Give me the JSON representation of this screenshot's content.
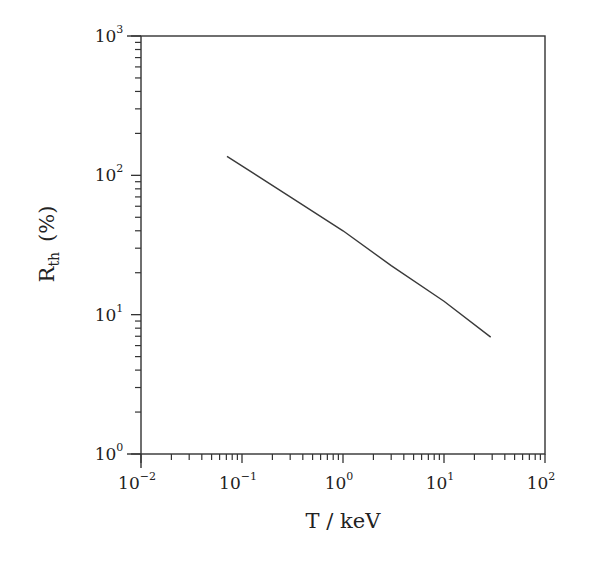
{
  "chart_data": {
    "type": "line",
    "title": "",
    "xlabel": "T / keV",
    "ylabel": "R_th (%)",
    "ylabel_main": "R",
    "ylabel_sub": "th",
    "ylabel_unit": "(%)",
    "xscale": "log",
    "yscale": "log",
    "xlim": [
      0.01,
      100
    ],
    "ylim": [
      1,
      1000
    ],
    "grid": false,
    "legend": null,
    "x_ticks": [
      "10^-2",
      "10^-1",
      "10^0",
      "10^1",
      "10^2"
    ],
    "y_ticks": [
      "10^0",
      "10^1",
      "10^2",
      "10^3"
    ],
    "x_tick_labels": [
      {
        "base": "10",
        "exp": "-2",
        "value": 0.01
      },
      {
        "base": "10",
        "exp": "-1",
        "value": 0.1
      },
      {
        "base": "10",
        "exp": "0",
        "value": 1
      },
      {
        "base": "10",
        "exp": "1",
        "value": 10
      },
      {
        "base": "10",
        "exp": "2",
        "value": 100
      }
    ],
    "y_tick_labels": [
      {
        "base": "10",
        "exp": "0",
        "value": 1
      },
      {
        "base": "10",
        "exp": "1",
        "value": 10
      },
      {
        "base": "10",
        "exp": "2",
        "value": 100
      },
      {
        "base": "10",
        "exp": "3",
        "value": 1000
      }
    ],
    "series": [
      {
        "name": "R_th",
        "x": [
          0.071,
          0.3,
          1,
          3,
          10,
          29
        ],
        "y": [
          137,
          70,
          40,
          22.5,
          12.5,
          6.9
        ],
        "color": "#333333"
      }
    ]
  },
  "colors": {
    "axis": "#333333",
    "line": "#3a3a3a",
    "background": "#ffffff"
  }
}
